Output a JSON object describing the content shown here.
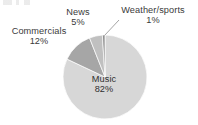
{
  "chart_data": {
    "type": "pie",
    "title": "",
    "subtitle": "",
    "xlabel": "",
    "ylabel": "",
    "legend_position": "none",
    "grid": false,
    "labels_inline": true,
    "units": "percent",
    "start_angle_deg": 0,
    "direction": "clockwise",
    "categories": [
      "Music",
      "Weather/sports",
      "News",
      "Commercials"
    ],
    "values": [
      82,
      1,
      5,
      12
    ],
    "slices": [
      {
        "name": "Music",
        "label": "Music",
        "value": 82,
        "value_text": "82%",
        "color": "#d7d7d7",
        "label_placement": "inside"
      },
      {
        "name": "Weather/sports",
        "label": "Weather/sports",
        "value": 1,
        "value_text": "1%",
        "color": "#8f8f8f",
        "label_placement": "outside",
        "leader_line": true
      },
      {
        "name": "News",
        "label": "News",
        "value": 5,
        "value_text": "5%",
        "color": "#c0c0c0",
        "label_placement": "outside",
        "leader_line": false
      },
      {
        "name": "Commercials",
        "label": "Commercials",
        "value": 12,
        "value_text": "12%",
        "color": "#a6a6a6",
        "label_placement": "outside",
        "leader_line": false
      }
    ]
  },
  "colors": {
    "background": "#ffffff",
    "text": "#3a3a3a",
    "slice_music": "#d7d7d7",
    "slice_commercials": "#a6a6a6",
    "slice_news": "#c0c0c0",
    "slice_weather": "#8f8f8f",
    "slice_outline": "#ffffff",
    "leader_line": "#9a9a9a"
  }
}
